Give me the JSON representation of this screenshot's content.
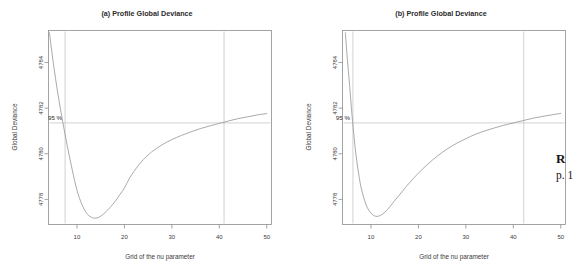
{
  "page": {
    "background": "#ffffff",
    "width": 588,
    "height": 279
  },
  "margin_note": {
    "line1": "R",
    "line2": "p. 1"
  },
  "panels": [
    {
      "id": "a",
      "title": "(a) Profile Global Deviance",
      "xlabel": "Grid of the nu parameter",
      "ylabel": "Global Deviance",
      "ci_label": "95 %"
    },
    {
      "id": "b",
      "title": "(b) Profile Global Deviance",
      "xlabel": "Grid of the nu parameter",
      "ylabel": "Global Deviance",
      "ci_label": "95 %"
    }
  ],
  "chart_data": [
    {
      "type": "line",
      "panel": "a",
      "title": "(a) Profile Global Deviance",
      "xlabel": "Grid of the nu parameter",
      "ylabel": "Global Deviance",
      "xlim": [
        4,
        51
      ],
      "ylim": [
        4776.9,
        4785.4
      ],
      "xticks": [
        10,
        20,
        30,
        40,
        50
      ],
      "yticks": [
        4778,
        4780,
        4782,
        4784
      ],
      "grid": false,
      "legend": null,
      "ci_level": "95 %",
      "ci_deviance": 4781.35,
      "ci_lower_nu": 7.5,
      "ci_upper_nu": 41.0,
      "minimum_nu": 14.0,
      "minimum_deviance": 4777.2,
      "x": [
        4.2,
        5,
        6,
        7,
        8,
        9,
        10,
        11,
        12,
        13,
        14,
        15,
        16,
        17,
        18,
        19,
        20,
        21,
        22,
        23,
        24,
        25,
        26,
        28,
        30,
        32,
        34,
        36,
        38,
        40,
        42,
        44,
        46,
        48,
        50
      ],
      "y": [
        4785.3,
        4784.0,
        4782.6,
        4781.4,
        4780.3,
        4779.3,
        4778.4,
        4777.8,
        4777.4,
        4777.22,
        4777.18,
        4777.26,
        4777.44,
        4777.65,
        4777.9,
        4778.2,
        4778.5,
        4778.9,
        4779.22,
        4779.5,
        4779.75,
        4779.95,
        4780.12,
        4780.4,
        4780.62,
        4780.8,
        4780.96,
        4781.1,
        4781.22,
        4781.33,
        4781.44,
        4781.54,
        4781.62,
        4781.7,
        4781.76
      ]
    },
    {
      "type": "line",
      "panel": "b",
      "title": "(b) Profile Global Deviance",
      "xlabel": "Grid of the nu parameter",
      "ylabel": "Global Deviance",
      "xlim": [
        4,
        51
      ],
      "ylim": [
        4776.9,
        4785.4
      ],
      "xticks": [
        10,
        20,
        30,
        40,
        50
      ],
      "yticks": [
        4778,
        4780,
        4782,
        4784
      ],
      "grid": false,
      "legend": null,
      "ci_level": "95 %",
      "ci_deviance": 4781.35,
      "ci_lower_nu": 6.2,
      "ci_upper_nu": 42.2,
      "minimum_nu": 11.5,
      "minimum_deviance": 4777.25,
      "x": [
        4.6,
        5,
        5.5,
        6,
        6.5,
        7,
        7.5,
        8,
        9,
        10,
        11,
        12,
        13,
        14,
        15,
        16,
        17,
        18,
        20,
        22,
        24,
        26,
        28,
        30,
        32,
        34,
        36,
        38,
        40,
        42,
        44,
        46,
        48,
        50
      ],
      "y": [
        4785.3,
        4784.2,
        4783.0,
        4781.7,
        4780.6,
        4779.7,
        4779.0,
        4778.45,
        4777.75,
        4777.4,
        4777.26,
        4777.3,
        4777.45,
        4777.68,
        4777.95,
        4778.2,
        4778.45,
        4778.7,
        4779.15,
        4779.55,
        4779.9,
        4780.2,
        4780.45,
        4780.66,
        4780.85,
        4781.0,
        4781.13,
        4781.25,
        4781.35,
        4781.45,
        4781.55,
        4781.63,
        4781.7,
        4781.77
      ]
    }
  ]
}
